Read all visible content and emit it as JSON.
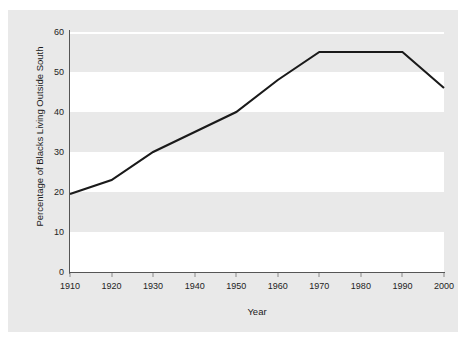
{
  "chart_data": {
    "type": "line",
    "title": "",
    "xlabel": "Year",
    "ylabel": "Percentage of Blacks Living Outside South",
    "xlim": [
      1910,
      2000
    ],
    "ylim": [
      0,
      60
    ],
    "grid": true,
    "legend": null,
    "x": [
      1910,
      1920,
      1930,
      1940,
      1950,
      1960,
      1970,
      1980,
      1990,
      2000
    ],
    "values": [
      19.5,
      23,
      30,
      35,
      40,
      48,
      55,
      55,
      55,
      46
    ],
    "series": [
      {
        "name": "Percentage of Blacks Living Outside South",
        "values": [
          19.5,
          23,
          30,
          35,
          40,
          48,
          55,
          55,
          55,
          46
        ]
      }
    ],
    "xticks": [
      "1910",
      "1920",
      "1930",
      "1940",
      "1950",
      "1960",
      "1970",
      "1980",
      "1990",
      "2000"
    ],
    "yticks": [
      "0",
      "10",
      "20",
      "30",
      "40",
      "50",
      "60"
    ],
    "ytick_values": [
      0,
      10,
      20,
      30,
      40,
      50,
      60
    ],
    "line_color": "#1a1a1a",
    "figure_background": "#e9e9e9",
    "band_color": "#ffffff",
    "axis_color": "#555555"
  }
}
